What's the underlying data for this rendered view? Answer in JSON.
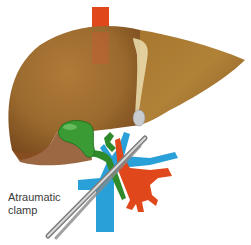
{
  "figure": {
    "labels": {
      "clamp_line1": "Atraumatic",
      "clamp_line2": "clamp"
    },
    "colors": {
      "liver": "#9a6a2e",
      "liver_light": "#b8843e",
      "liver_dark": "#7a4a1e",
      "ivc_artery": "#e0481c",
      "portal_vein": "#2aa0d8",
      "bile_duct": "#2e8a2a",
      "gallbladder": "#3a9a34",
      "ligament": "#e8d8a8",
      "clamp": "#9a9a9a",
      "label_text": "#3a3a3a",
      "background": "#ffffff"
    }
  }
}
